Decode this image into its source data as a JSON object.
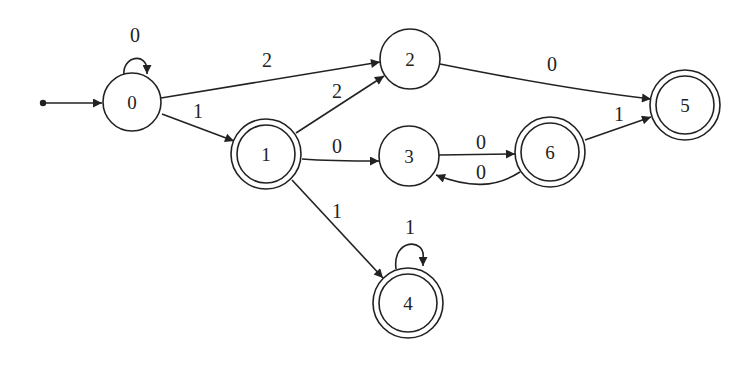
{
  "diagram": {
    "type": "finite-automaton",
    "start_state": "0",
    "nodes": [
      {
        "id": "0",
        "label": "0",
        "x": 132,
        "y": 102,
        "accepting": false
      },
      {
        "id": "1",
        "label": "1",
        "x": 266,
        "y": 154,
        "accepting": true
      },
      {
        "id": "2",
        "label": "2",
        "x": 410,
        "y": 59,
        "accepting": false
      },
      {
        "id": "3",
        "label": "3",
        "x": 409,
        "y": 156,
        "accepting": false
      },
      {
        "id": "4",
        "label": "4",
        "x": 408,
        "y": 303,
        "accepting": true
      },
      {
        "id": "5",
        "label": "5",
        "x": 685,
        "y": 105,
        "accepting": true
      },
      {
        "id": "6",
        "label": "6",
        "x": 550,
        "y": 152,
        "accepting": true
      }
    ],
    "edges": [
      {
        "from": "0",
        "to": "0",
        "label": "0"
      },
      {
        "from": "0",
        "to": "2",
        "label": "2"
      },
      {
        "from": "0",
        "to": "1",
        "label": "1"
      },
      {
        "from": "1",
        "to": "2",
        "label": "2"
      },
      {
        "from": "1",
        "to": "3",
        "label": "0"
      },
      {
        "from": "1",
        "to": "4",
        "label": "1"
      },
      {
        "from": "4",
        "to": "4",
        "label": "1"
      },
      {
        "from": "2",
        "to": "5",
        "label": "0"
      },
      {
        "from": "3",
        "to": "6",
        "label": "0"
      },
      {
        "from": "6",
        "to": "3",
        "label": "0"
      },
      {
        "from": "6",
        "to": "5",
        "label": "1"
      }
    ],
    "colors": {
      "stroke": "#222222",
      "background": "#ffffff"
    }
  }
}
